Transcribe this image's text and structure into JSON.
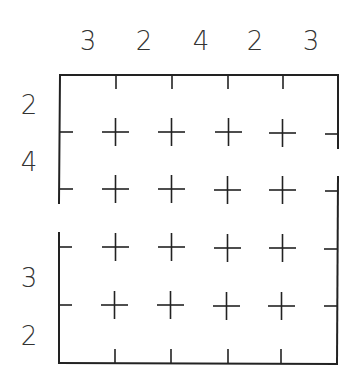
{
  "puzzle": {
    "rows": 5,
    "cols": 5,
    "column_clues": [
      "3",
      "2",
      "4",
      "2",
      "3"
    ],
    "row_clues": [
      "2",
      "4",
      "",
      "3",
      "2"
    ],
    "left_opening_row": 3,
    "right_opening_row": 2,
    "line_color": "#222222",
    "clue_color": "#333333"
  }
}
